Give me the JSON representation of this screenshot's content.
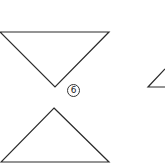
{
  "figure": {
    "label": "6",
    "stroke_color": "#2a2a2a",
    "background": "#ffffff",
    "shapes": [
      {
        "name": "inverted-triangle",
        "points": [
          [
            0,
            32
          ],
          [
            109,
            32
          ],
          [
            55,
            87
          ]
        ]
      },
      {
        "name": "upright-triangle",
        "points": [
          [
            54,
            108
          ],
          [
            109,
            162
          ],
          [
            1,
            162
          ]
        ]
      },
      {
        "name": "partial-triangle-right",
        "points": [
          [
            148,
            87
          ],
          [
            165,
            69
          ],
          [
            165,
            87
          ]
        ]
      }
    ]
  }
}
